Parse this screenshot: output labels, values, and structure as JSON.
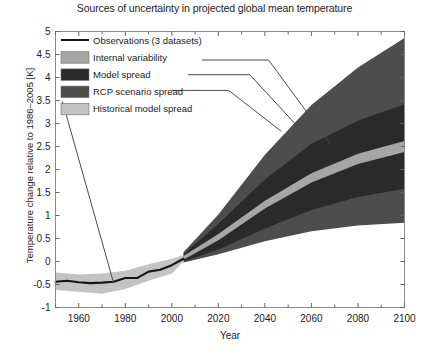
{
  "chart_data": {
    "type": "area",
    "title": "Sources of uncertainty in projected global mean temperature",
    "xlabel": "Year",
    "ylabel": "Temperature change relative to 1986–2005 [K]",
    "xlim": [
      1950,
      2100
    ],
    "ylim": [
      -1,
      5
    ],
    "xticks": [
      1960,
      1980,
      2000,
      2020,
      2040,
      2060,
      2080,
      2100
    ],
    "xtick_labels": [
      "1960",
      "1980",
      "2000",
      "2020",
      "2040",
      "2060",
      "2080",
      "2100"
    ],
    "xminor_step": 10,
    "yticks": [
      -1,
      -0.5,
      0,
      0.5,
      1,
      1.5,
      2,
      2.5,
      3,
      3.5,
      4,
      4.5,
      5
    ],
    "ytick_labels": [
      "-1",
      "-0.5",
      "0",
      "0.5",
      "1",
      "1.5",
      "2",
      "2.5",
      "3",
      "3.5",
      "4",
      "4.5",
      "5"
    ],
    "grid": false,
    "legend_position": "upper-left",
    "split_year": 2005,
    "series": [
      {
        "name": "Observations (3 datasets)",
        "type": "line",
        "color": "#151515",
        "x": [
          1950,
          1955,
          1960,
          1965,
          1970,
          1975,
          1980,
          1985,
          1990,
          1995,
          2000,
          2005
        ],
        "values": [
          -0.44,
          -0.42,
          -0.45,
          -0.47,
          -0.46,
          -0.44,
          -0.36,
          -0.36,
          -0.22,
          -0.18,
          -0.08,
          0.06
        ]
      },
      {
        "name": "Historical model spread",
        "type": "band",
        "color": "#c3c3c3",
        "x": [
          1950,
          1960,
          1970,
          1980,
          1990,
          2000,
          2005
        ],
        "lower": [
          -0.62,
          -0.66,
          -0.7,
          -0.6,
          -0.42,
          -0.26,
          0.0
        ],
        "upper": [
          -0.24,
          -0.28,
          -0.26,
          -0.2,
          -0.06,
          0.06,
          0.14
        ]
      },
      {
        "name": "Internal variability",
        "type": "band",
        "color": "#a6a6a6",
        "x": [
          2005,
          2020,
          2040,
          2060,
          2080,
          2100
        ],
        "lower": [
          0.04,
          0.46,
          1.15,
          1.72,
          2.12,
          2.38
        ],
        "upper": [
          0.12,
          0.6,
          1.32,
          1.92,
          2.34,
          2.62
        ]
      },
      {
        "name": "Model spread",
        "type": "band",
        "color": "#2a2a2a",
        "x": [
          2005,
          2020,
          2040,
          2060,
          2080,
          2100
        ],
        "lower": [
          0.0,
          0.26,
          0.72,
          1.12,
          1.4,
          1.58
        ],
        "upper": [
          0.16,
          0.82,
          1.78,
          2.56,
          3.06,
          3.42
        ]
      },
      {
        "name": "RCP scenario spread",
        "type": "band",
        "color": "#4d4d4d",
        "x": [
          2005,
          2020,
          2040,
          2060,
          2080,
          2100
        ],
        "lower": [
          -0.02,
          0.16,
          0.44,
          0.66,
          0.78,
          0.84
        ],
        "upper": [
          0.2,
          1.02,
          2.32,
          3.4,
          4.22,
          4.86
        ]
      }
    ],
    "legend_entries": [
      {
        "label": "Observations (3 datasets)",
        "marker": "line",
        "color": "#151515"
      },
      {
        "label": "Internal variability",
        "marker": "swatch",
        "color": "#a6a6a6"
      },
      {
        "label": "Model spread",
        "marker": "swatch",
        "color": "#2a2a2a"
      },
      {
        "label": "RCP scenario spread",
        "marker": "swatch",
        "color": "#4d4d4d"
      },
      {
        "label": "Historical model spread",
        "marker": "swatch",
        "color": "#c3c3c3"
      }
    ],
    "annotations": [
      {
        "label": "internal-variability-leader",
        "from": [
          2013,
          4.38
        ],
        "to": [
          2068,
          2.56
        ]
      },
      {
        "label": "model-spread-leader",
        "from": [
          2007,
          4.06
        ],
        "to": [
          2058,
          2.72
        ]
      },
      {
        "label": "rcp-scenario-spread-leader",
        "from": [
          2000,
          3.72
        ],
        "to": [
          2047,
          2.83
        ]
      },
      {
        "label": "historical-model-spread-leader",
        "from": [
          1953,
          3.48
        ],
        "to": [
          1975,
          -0.47
        ]
      }
    ]
  }
}
